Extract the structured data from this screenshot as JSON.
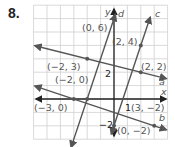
{
  "problem_number": "8.",
  "graph": {
    "x_range": [
      -6,
      4
    ],
    "y_range": [
      -3,
      7
    ],
    "axis_labels": {
      "x": "x",
      "y": "y"
    },
    "tick_labels": {
      "x_1": "1",
      "y_2": "2",
      "y_neg2": "−2"
    },
    "lines": [
      {
        "name": "a",
        "p1": [
          -2,
          3
        ],
        "p2": [
          2,
          2
        ]
      },
      {
        "name": "b",
        "p1": [
          -3,
          0
        ],
        "p2": [
          3,
          -2
        ]
      },
      {
        "name": "c",
        "p1": [
          0,
          -2
        ],
        "p2": [
          2,
          4
        ]
      },
      {
        "name": "d",
        "p1": [
          -2,
          0
        ],
        "p2": [
          0,
          6
        ]
      }
    ],
    "points": [
      {
        "label": "(0, 6)",
        "x": 0,
        "y": 6
      },
      {
        "label": "(2, 4)",
        "x": 2,
        "y": 4
      },
      {
        "label": "(−2, 3)",
        "x": -2,
        "y": 3
      },
      {
        "label": "(2, 2)",
        "x": 2,
        "y": 2
      },
      {
        "label": "(−2, 0)",
        "x": -2,
        "y": 0
      },
      {
        "label": "(−3, 0)",
        "x": -3,
        "y": 0
      },
      {
        "label": "(3, −2)",
        "x": 3,
        "y": -2
      },
      {
        "label": "(0, −2)",
        "x": 0,
        "y": -2
      }
    ],
    "colors": {
      "grid": "#cfcfcf",
      "line": "#555555",
      "axis": "#222222",
      "text": "#555555"
    }
  }
}
